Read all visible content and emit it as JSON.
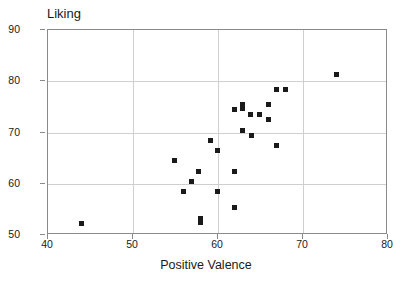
{
  "chart_data": {
    "type": "scatter",
    "title": "Liking",
    "xlabel": "Positive Valence",
    "ylabel": "Liking",
    "xlim": [
      40,
      80
    ],
    "ylim": [
      50,
      90
    ],
    "xticks": [
      40,
      50,
      60,
      70,
      80
    ],
    "yticks": [
      50,
      60,
      70,
      80,
      90
    ],
    "grid": true,
    "legend": null,
    "marker": "square",
    "marker_color": "#1a1a1a",
    "points": [
      {
        "x": 44.0,
        "y": 52.0
      },
      {
        "x": 55.0,
        "y": 64.3
      },
      {
        "x": 56.0,
        "y": 58.3
      },
      {
        "x": 57.0,
        "y": 60.2
      },
      {
        "x": 57.8,
        "y": 62.2
      },
      {
        "x": 58.0,
        "y": 53.0
      },
      {
        "x": 58.0,
        "y": 52.3
      },
      {
        "x": 59.2,
        "y": 68.3
      },
      {
        "x": 60.0,
        "y": 66.2
      },
      {
        "x": 60.0,
        "y": 58.3
      },
      {
        "x": 62.0,
        "y": 74.2
      },
      {
        "x": 62.0,
        "y": 62.2
      },
      {
        "x": 62.0,
        "y": 55.2
      },
      {
        "x": 63.0,
        "y": 75.3
      },
      {
        "x": 63.0,
        "y": 74.4
      },
      {
        "x": 63.0,
        "y": 70.2
      },
      {
        "x": 63.9,
        "y": 73.3
      },
      {
        "x": 64.0,
        "y": 69.3
      },
      {
        "x": 65.0,
        "y": 73.3
      },
      {
        "x": 66.0,
        "y": 75.3
      },
      {
        "x": 66.0,
        "y": 72.3
      },
      {
        "x": 67.0,
        "y": 78.2
      },
      {
        "x": 67.0,
        "y": 67.3
      },
      {
        "x": 68.0,
        "y": 78.2
      },
      {
        "x": 74.0,
        "y": 81.2
      }
    ]
  }
}
